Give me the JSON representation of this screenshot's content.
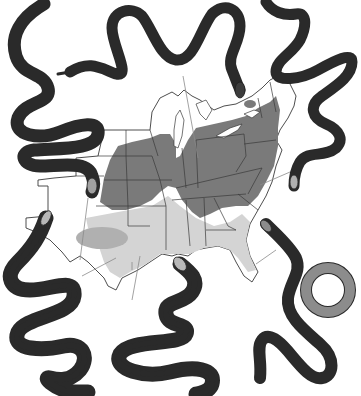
{
  "illustration": {
    "subject": "Range map of the eastern United States with six surrounding snake illustrations",
    "colors": {
      "background": "#ffffff",
      "range_dark": "#7a7a7a",
      "range_light": "#d4d4d4",
      "range_mid": "#b0b0b0",
      "land": "#ffffff",
      "outline": "#2a2a2a",
      "snake_dark": "#3c3c3c",
      "snake_medium": "#8c8c8c",
      "snake_light": "#b8b8b8"
    },
    "snakes": [
      {
        "position": "top-left",
        "pattern": "striped",
        "tone": "medium"
      },
      {
        "position": "top-center",
        "pattern": "solid",
        "tone": "dark"
      },
      {
        "position": "top-right",
        "pattern": "striped",
        "tone": "light"
      },
      {
        "position": "bottom-left",
        "pattern": "blotched",
        "tone": "light"
      },
      {
        "position": "bottom-center",
        "pattern": "blotched",
        "tone": "light"
      },
      {
        "position": "bottom-right",
        "pattern": "plain-coiled",
        "tone": "medium"
      }
    ],
    "map": {
      "region": "Eastern and central United States",
      "range_zones": [
        "dark northern/central range",
        "light southern range",
        "medium isolated west-Texas patch"
      ]
    }
  }
}
